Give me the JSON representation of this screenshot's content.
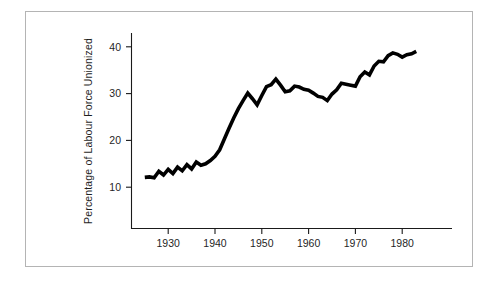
{
  "figure": {
    "border_color": "#b4b4b4",
    "background": "#ffffff",
    "line_color": "#000000",
    "axis_color": "#1a1a1a"
  },
  "axes": {
    "y_title": "Percentage of Labour Force Unionized",
    "y_ticks": [
      "10",
      "20",
      "30",
      "40"
    ],
    "x_ticks": [
      "1930",
      "1940",
      "1950",
      "1960",
      "1970",
      "1980"
    ]
  },
  "chart_data": {
    "type": "line",
    "title": "",
    "xlabel": "",
    "ylabel": "Percentage of Labour Force Unionized",
    "xlim": [
      1923,
      1985
    ],
    "ylim": [
      0,
      44
    ],
    "xticks": [
      1930,
      1940,
      1950,
      1960,
      1970,
      1980
    ],
    "yticks": [
      10,
      20,
      30,
      40
    ],
    "grid": false,
    "legend": "none",
    "series": [
      {
        "name": "Percentage of Labour Force Unionized",
        "x": [
          1925,
          1926,
          1927,
          1928,
          1929,
          1930,
          1931,
          1932,
          1933,
          1934,
          1935,
          1936,
          1937,
          1938,
          1939,
          1940,
          1941,
          1942,
          1943,
          1944,
          1945,
          1946,
          1947,
          1948,
          1949,
          1950,
          1951,
          1952,
          1953,
          1954,
          1955,
          1956,
          1957,
          1958,
          1959,
          1960,
          1961,
          1962,
          1963,
          1964,
          1965,
          1966,
          1967,
          1968,
          1969,
          1970,
          1971,
          1972,
          1973,
          1974,
          1975,
          1976,
          1977,
          1978,
          1979,
          1980,
          1981,
          1982,
          1983
        ],
        "y": [
          12.1,
          12.2,
          12.0,
          13.4,
          12.6,
          13.8,
          12.9,
          14.3,
          13.5,
          14.8,
          13.9,
          15.4,
          14.7,
          15.0,
          15.7,
          16.6,
          18.0,
          20.3,
          22.6,
          24.8,
          26.8,
          28.5,
          30.1,
          28.9,
          27.6,
          29.6,
          31.5,
          31.9,
          33.1,
          31.8,
          30.4,
          30.6,
          31.6,
          31.4,
          30.9,
          30.7,
          30.1,
          29.4,
          29.2,
          28.5,
          29.9,
          30.8,
          32.2,
          32.0,
          31.8,
          31.6,
          33.6,
          34.6,
          34.0,
          35.9,
          36.9,
          36.8,
          38.1,
          38.7,
          38.4,
          37.8,
          38.3,
          38.5,
          39.0
        ]
      }
    ]
  }
}
